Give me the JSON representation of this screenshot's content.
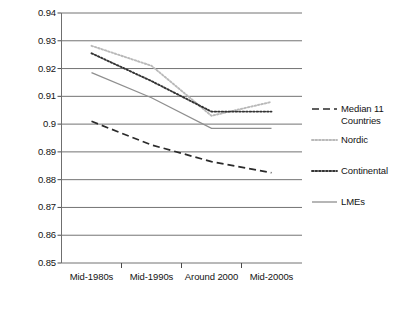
{
  "chart_data": {
    "type": "line",
    "title": "",
    "subtitle": "",
    "xlabel": "",
    "ylabel": "",
    "categories": [
      "Mid-1980s",
      "Mid-1990s",
      "Around 2000",
      "Mid-2000s"
    ],
    "ylim": [
      0.85,
      0.94
    ],
    "ytick_labels": [
      "0.94",
      "0.93",
      "0.92",
      "0.91",
      "0.9",
      "0.89",
      "0.88",
      "0.87",
      "0.86",
      "0.85"
    ],
    "ytick_values": [
      0.94,
      0.93,
      0.92,
      0.91,
      0.9,
      0.89,
      0.88,
      0.87,
      0.86,
      0.85
    ],
    "grid": true,
    "grid_orientation": "horizontal",
    "legend_position": "right",
    "series": [
      {
        "name": "Median 11 Countries",
        "style": "dashed",
        "color": "#2b2b2b",
        "values": [
          0.901,
          0.8925,
          0.8865,
          0.8825
        ]
      },
      {
        "name": "Nordic",
        "style": "dotted-light",
        "color": "#b9b9b9",
        "values": [
          0.9282,
          0.921,
          0.903,
          0.908
        ]
      },
      {
        "name": "Continental",
        "style": "dotted-dark",
        "color": "#333333",
        "values": [
          0.9255,
          0.9155,
          0.9045,
          0.9045
        ]
      },
      {
        "name": "LMEs",
        "style": "solid",
        "color": "#8f8f8f",
        "values": [
          0.9185,
          0.9095,
          0.8985,
          0.8985
        ]
      }
    ]
  },
  "axes": {
    "y_labels": [
      "0.94",
      "0.93",
      "0.92",
      "0.91",
      "0.9",
      "0.89",
      "0.88",
      "0.87",
      "0.86",
      "0.85"
    ],
    "x_labels": [
      "Mid-1980s",
      "Mid-1990s",
      "Around 2000",
      "Mid-2000s"
    ]
  },
  "legend": {
    "items": [
      {
        "label": "Median 11\nCountries",
        "swatch": "dashed-swatch"
      },
      {
        "label": "Nordic",
        "swatch": "dotted-light-swatch"
      },
      {
        "label": "Continental",
        "swatch": "dotted-dark-swatch"
      },
      {
        "label": "LMEs",
        "swatch": "solid-swatch"
      }
    ]
  }
}
